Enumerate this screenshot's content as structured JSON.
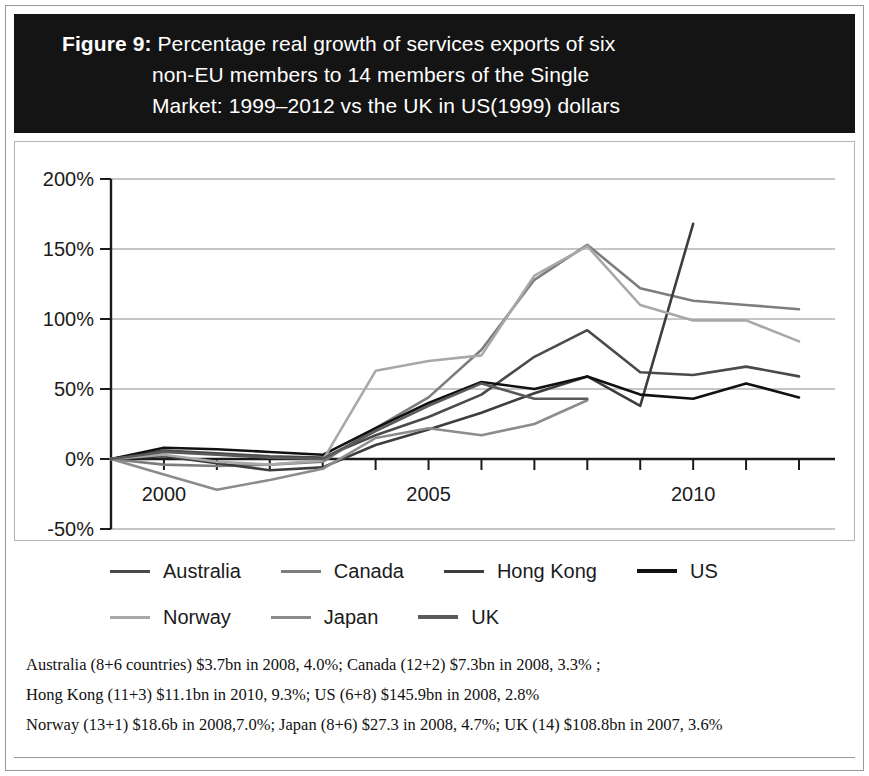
{
  "title": {
    "figure_label": "Figure 9:",
    "line1": " Percentage real growth of services exports of six",
    "line2": "non-EU members to 14 members of the Single",
    "line3": "Market: 1999–2012 vs the UK in US(1999) dollars",
    "full": "Figure 9: Percentage real growth of services exports of six non-EU members to 14 members of the Single Market: 1999–2012 vs the UK in US(1999) dollars",
    "background_color": "#141414",
    "text_color": "#ffffff"
  },
  "legend": {
    "row1": [
      {
        "label": "Australia",
        "color": "#4a4a4a",
        "width": 3
      },
      {
        "label": "Canada",
        "color": "#7d7d7d",
        "width": 3
      },
      {
        "label": "Hong Kong",
        "color": "#3d3d3d",
        "width": 3
      },
      {
        "label": "US",
        "color": "#111111",
        "width": 4
      }
    ],
    "row2": [
      {
        "label": "Norway",
        "color": "#a8a8a8",
        "width": 3
      },
      {
        "label": "Japan",
        "color": "#8c8c8c",
        "width": 3
      },
      {
        "label": "UK",
        "color": "#5a5a5a",
        "width": 4
      }
    ]
  },
  "footnotes": [
    "Australia (8+6 countries) $3.7bn in 2008, 4.0%; Canada (12+2) $7.3bn in 2008, 3.3% ;",
    "Hong Kong (11+3) $11.1bn in 2010, 9.3%; US (6+8) $145.9bn in 2008, 2.8%",
    "Norway (13+1) $18.6b in 2008,7.0%; Japan (8+6) $27.3 in 2008, 4.7%; UK (14) $108.8bn in 2007, 3.6%"
  ],
  "chart_data": {
    "type": "line",
    "title": "Percentage real growth of services exports of six non-EU members to 14 members of the Single Market: 1999–2012 vs the UK in US(1999) dollars",
    "xlabel": "",
    "ylabel": "",
    "x": [
      1999,
      2000,
      2001,
      2002,
      2003,
      2004,
      2005,
      2006,
      2007,
      2008,
      2009,
      2010,
      2011,
      2012
    ],
    "x_tick_labels": [
      "2000",
      "2005",
      "2010"
    ],
    "x_tick_values": [
      2000,
      2005,
      2010
    ],
    "xlim": [
      1999,
      2012
    ],
    "ylim": [
      -50,
      200
    ],
    "y_tick_labels": [
      "-50%",
      "0%",
      "50%",
      "100%",
      "150%",
      "200%"
    ],
    "y_tick_values": [
      -50,
      0,
      50,
      100,
      150,
      200
    ],
    "grid": "horizontal",
    "legend_position": "bottom",
    "series": [
      {
        "name": "Australia",
        "color": "#4a4a4a",
        "values": [
          0,
          6,
          4,
          2,
          1,
          17,
          30,
          46,
          73,
          92,
          62,
          60,
          66,
          59
        ]
      },
      {
        "name": "Canada",
        "color": "#7d7d7d",
        "values": [
          0,
          -4,
          -5,
          -4,
          -2,
          22,
          44,
          78,
          128,
          153,
          122,
          113,
          110,
          107
        ]
      },
      {
        "name": "Hong Kong",
        "color": "#3d3d3d",
        "values": [
          0,
          2,
          -3,
          -8,
          -6,
          10,
          21,
          33,
          47,
          59,
          38,
          168,
          null,
          null
        ]
      },
      {
        "name": "US",
        "color": "#111111",
        "values": [
          0,
          8,
          7,
          5,
          3,
          22,
          40,
          55,
          50,
          59,
          46,
          43,
          54,
          44
        ]
      },
      {
        "name": "Norway",
        "color": "#a8a8a8",
        "values": [
          0,
          3,
          -2,
          -4,
          -1,
          63,
          70,
          74,
          131,
          152,
          110,
          99,
          99,
          84
        ]
      },
      {
        "name": "Japan",
        "color": "#8c8c8c",
        "values": [
          0,
          -11,
          -22,
          -15,
          -7,
          15,
          22,
          17,
          25,
          42,
          null,
          null,
          null,
          null
        ]
      },
      {
        "name": "UK",
        "color": "#5a5a5a",
        "values": [
          0,
          5,
          3,
          1,
          0,
          20,
          38,
          54,
          43,
          43,
          null,
          null,
          null,
          null
        ]
      }
    ]
  }
}
